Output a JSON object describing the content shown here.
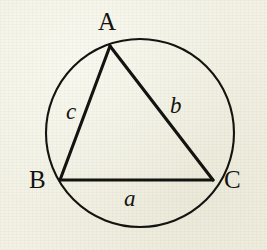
{
  "figure": {
    "kind": "inscribed-triangle-in-circle",
    "canvas": {
      "width": 267,
      "height": 250
    },
    "colors": {
      "background": "#f2f1e4",
      "ink": "#131310"
    },
    "circle": {
      "name": "circumcircle",
      "cx": 140,
      "cy": 133,
      "r": 94,
      "stroke_width": 2.1
    },
    "triangle": {
      "name": "triangle-ABC",
      "stroke_width": 3.1,
      "vertices": [
        {
          "id": "A",
          "x": 110,
          "y": 46
        },
        {
          "id": "B",
          "x": 60,
          "y": 180
        },
        {
          "id": "C",
          "x": 213,
          "y": 180
        }
      ]
    },
    "vertex_labels": [
      {
        "id": "A",
        "text": "A"
      },
      {
        "id": "B",
        "text": "B"
      },
      {
        "id": "C",
        "text": "C"
      }
    ],
    "side_labels": [
      {
        "id": "a",
        "text": "a",
        "opposite_vertex": "A",
        "segment": "BC"
      },
      {
        "id": "b",
        "text": "b",
        "opposite_vertex": "B",
        "segment": "AC"
      },
      {
        "id": "c",
        "text": "c",
        "opposite_vertex": "C",
        "segment": "AB"
      }
    ]
  }
}
